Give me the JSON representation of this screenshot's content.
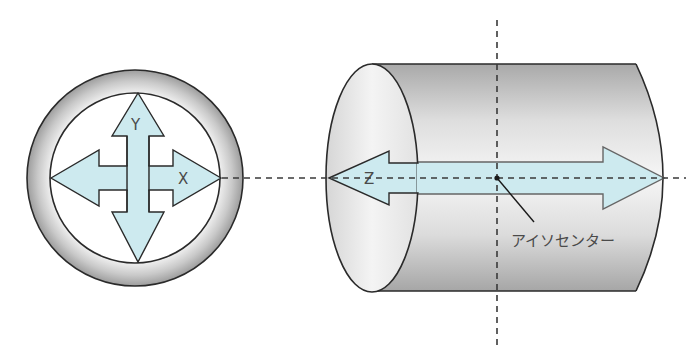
{
  "diagram": {
    "labels": {
      "x_axis": "X",
      "y_axis": "Y",
      "z_axis": "Z",
      "isocenter": "アイソセンター"
    },
    "colors": {
      "arrow_fill": "#cdeaef",
      "outline": "#2a2a2a",
      "ring_gray": "#b8b8b8",
      "cylinder_gray": "#c4c4c4",
      "axis_line": "#3a3a3a",
      "text": "#4a4a4a"
    },
    "elements": {
      "front_view": "circular gantry bore front view with X/Y arrows",
      "side_view": "cylindrical bore side view with Z arrow and isocenter"
    }
  }
}
